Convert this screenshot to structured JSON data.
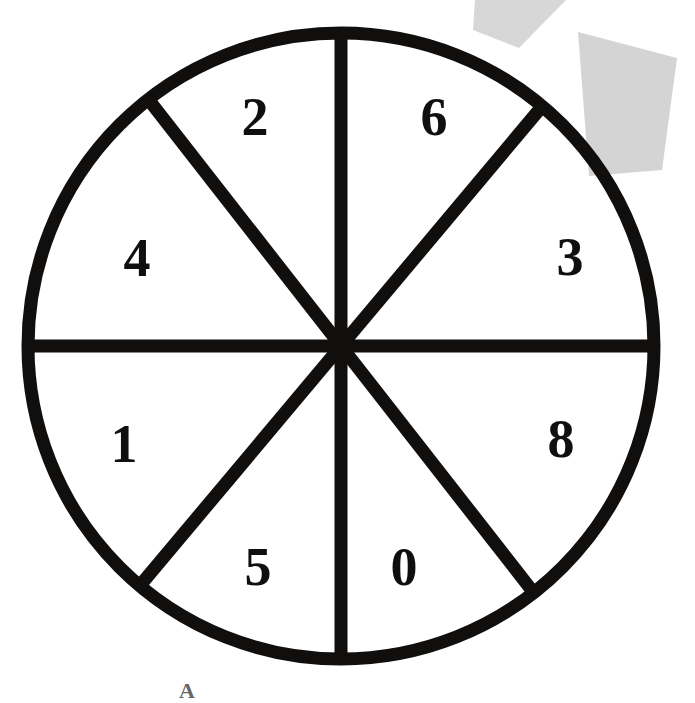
{
  "figure": {
    "kind": "spinner-wheel",
    "title": "",
    "background_color": "#ffffff",
    "stroke_color": "#100f0d",
    "label_color": "#100f0d",
    "artifact_color": "#d4d4d4"
  },
  "wheel": {
    "center_x": 341,
    "center_y": 346,
    "radius": 313,
    "stroke_width": 13,
    "sector_count": 8,
    "divider_count": 4
  },
  "chart_data": {
    "type": "pie",
    "xlabel": "",
    "ylabel": "",
    "grid": false,
    "legend": "none",
    "categories": [
      "6",
      "3",
      "8",
      "0",
      "5",
      "1",
      "4",
      "2"
    ],
    "values": [
      12.5,
      12.5,
      12.5,
      12.5,
      12.5,
      12.5,
      12.5,
      12.5
    ],
    "labels": [
      "6",
      "3",
      "8",
      "0",
      "5",
      "1",
      "4",
      "2"
    ],
    "annotations": []
  },
  "sectors": [
    {
      "label": "2",
      "label_x": 255,
      "label_y": 124,
      "start_deg": -90,
      "end_deg": -45
    },
    {
      "label": "6",
      "label_x": 434,
      "label_y": 124,
      "start_deg": -45,
      "end_deg": 0
    },
    {
      "label": "3",
      "label_x": 570,
      "label_y": 264,
      "start_deg": 0,
      "end_deg": 45
    },
    {
      "label": "8",
      "label_x": 561,
      "label_y": 446,
      "start_deg": 45,
      "end_deg": 90
    },
    {
      "label": "0",
      "label_x": 404,
      "label_y": 574,
      "start_deg": 90,
      "end_deg": 135
    },
    {
      "label": "5",
      "label_x": 258,
      "label_y": 574,
      "start_deg": 135,
      "end_deg": 180
    },
    {
      "label": "1",
      "label_x": 124,
      "label_y": 451,
      "start_deg": 180,
      "end_deg": 225
    },
    {
      "label": "4",
      "label_x": 137,
      "label_y": 265,
      "start_deg": 225,
      "end_deg": 270
    }
  ],
  "dividers": [
    {
      "name": "vertical-divider",
      "angle_deg": 90
    },
    {
      "name": "horizontal-divider",
      "angle_deg": 0
    },
    {
      "name": "diagonal-divider-nw-se",
      "angle_deg": 52
    },
    {
      "name": "diagonal-divider-ne-sw",
      "angle_deg": -50
    }
  ],
  "artifacts": [
    {
      "name": "scan-artifact-wedge",
      "points": "475,0 566,0 519,48 473,30"
    },
    {
      "name": "scan-artifact-square",
      "points": "578,32 677,58 662,170 589,176"
    }
  ],
  "bottom_mark": {
    "glyph": "A"
  }
}
